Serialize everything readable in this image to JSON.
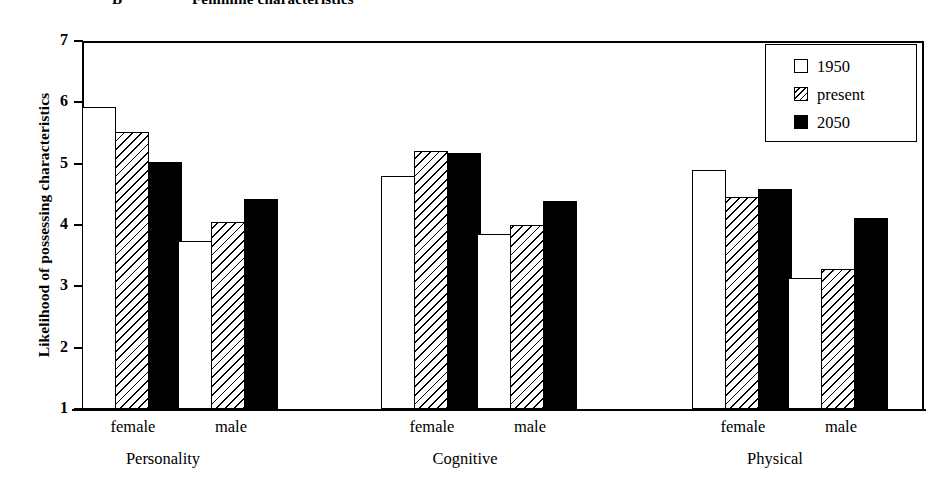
{
  "caption": {
    "letter": "B",
    "text": "Feminine characteristics"
  },
  "chart_data": {
    "type": "bar",
    "title": "Feminine characteristics",
    "xlabel": "",
    "ylabel": "Likelihood of possessing characteristics",
    "ylim": [
      1,
      7
    ],
    "yticks": [
      "1",
      "2",
      "3",
      "4",
      "5",
      "6",
      "7"
    ],
    "grid": false,
    "legend_position": "top-right",
    "categories": [
      "Personality / female",
      "Personality / male",
      "Cognitive / female",
      "Cognitive / male",
      "Physical / female",
      "Physical / male"
    ],
    "groups": [
      {
        "name": "Personality",
        "subgroups": [
          {
            "name": "female",
            "values": [
              5.92,
              5.52,
              5.02
            ]
          },
          {
            "name": "male",
            "values": [
              3.74,
              4.05,
              4.43
            ]
          }
        ]
      },
      {
        "name": "Cognitive",
        "subgroups": [
          {
            "name": "female",
            "values": [
              4.8,
              5.2,
              5.18
            ]
          },
          {
            "name": "male",
            "values": [
              3.85,
              4.0,
              4.39
            ]
          }
        ]
      },
      {
        "name": "Physical",
        "subgroups": [
          {
            "name": "female",
            "values": [
              4.89,
              4.45,
              4.58
            ]
          },
          {
            "name": "male",
            "values": [
              3.13,
              3.28,
              4.11
            ]
          }
        ]
      }
    ],
    "series": [
      {
        "name": "1950",
        "fill": "white",
        "values": [
          5.92,
          3.74,
          4.8,
          3.85,
          4.89,
          3.13
        ]
      },
      {
        "name": "present",
        "fill": "hatch",
        "values": [
          5.52,
          4.05,
          5.2,
          4.0,
          4.45,
          3.28
        ]
      },
      {
        "name": "2050",
        "fill": "black",
        "values": [
          5.02,
          4.43,
          5.18,
          4.39,
          4.58,
          4.11
        ]
      }
    ],
    "legend": [
      {
        "label": "1950",
        "fill": "white"
      },
      {
        "label": "present",
        "fill": "hatch"
      },
      {
        "label": "2050",
        "fill": "black"
      }
    ],
    "colors": {
      "bar_white": "#ffffff",
      "bar_black": "#000000",
      "outline": "#000000",
      "background": "#ffffff"
    }
  },
  "axis": {
    "y_title": "Likelihood of possessing characteristics",
    "y_ticks": [
      "7",
      "6",
      "5",
      "4",
      "3",
      "2",
      "1"
    ]
  },
  "x_labels": {
    "sexes": [
      "female",
      "male",
      "female",
      "male",
      "female",
      "male"
    ],
    "groups": [
      "Personality",
      "Cognitive",
      "Physical"
    ]
  }
}
